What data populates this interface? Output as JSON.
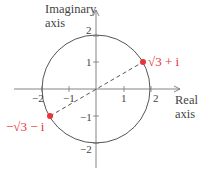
{
  "diagram": {
    "axes": {
      "y_title_line1": "Imaginary",
      "y_title_line2": "axis",
      "x_title_line1": "Real",
      "x_title_line2": "axis",
      "x_ticks": [
        "−2",
        "−1",
        "1",
        "2"
      ],
      "y_ticks": [
        "2",
        "1",
        "−1",
        "−2"
      ]
    },
    "circle": {
      "center": [
        0,
        0
      ],
      "radius": 2
    },
    "points": [
      {
        "label": "√3 + i",
        "x": 1.732,
        "y": 1
      },
      {
        "label": "−√3 − i",
        "x": -1.732,
        "y": -1
      }
    ],
    "segment": {
      "style": "dashed",
      "from": "−√3 − i",
      "to": "√3 + i"
    },
    "colors": {
      "accent": "#e8333a",
      "lines": "#555555",
      "text": "#444444"
    }
  }
}
